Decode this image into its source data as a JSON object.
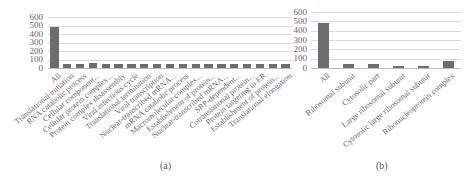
{
  "chart_data": [
    {
      "id": "a",
      "type": "bar",
      "title": "",
      "caption": "(a)",
      "xlabel": "",
      "ylabel": "",
      "ylim": [
        0,
        600
      ],
      "yticks": [
        0,
        100,
        200,
        300,
        400,
        500,
        600
      ],
      "grid": true,
      "legend": null,
      "categories": [
        "All",
        "Translational initiation",
        "RNA catabolic process",
        "Cellular component...",
        "Cellular protein complex...",
        "Protein complex disassembly",
        "Viral infectious cycle",
        "Translational termination",
        "Viral transcription",
        "Nuclear-transcribed mRNA...",
        "mRNA catabolic process",
        "Macromolecular complex...",
        "Establishment of protein...",
        "Nuclear-transcribed mRNA...",
        "SRP-dependent...",
        "Cotranslational protein...",
        "Protein targeting to ER",
        "Establishment of protein...",
        "Translational elongation"
      ],
      "values": [
        480,
        45,
        45,
        55,
        42,
        42,
        42,
        42,
        42,
        42,
        42,
        42,
        50,
        42,
        42,
        42,
        42,
        42,
        45
      ]
    },
    {
      "id": "b",
      "type": "bar",
      "title": "",
      "caption": "(b)",
      "xlabel": "",
      "ylabel": "",
      "ylim": [
        0,
        600
      ],
      "yticks": [
        0,
        100,
        200,
        300,
        400,
        500,
        600
      ],
      "grid": true,
      "legend": null,
      "categories": [
        "All",
        "Ribosomal subunit",
        "Cytosolic part",
        "Large ribosomal subunit",
        "Cytosolic large ribosomal subunit",
        "Ribonucleoprotein complex"
      ],
      "values": [
        480,
        42,
        42,
        22,
        22,
        75
      ]
    }
  ],
  "captions": {
    "a": "(a)",
    "b": "(b)"
  },
  "bar_color": "#6d6d6d",
  "grid_color": "#dcdcdc"
}
